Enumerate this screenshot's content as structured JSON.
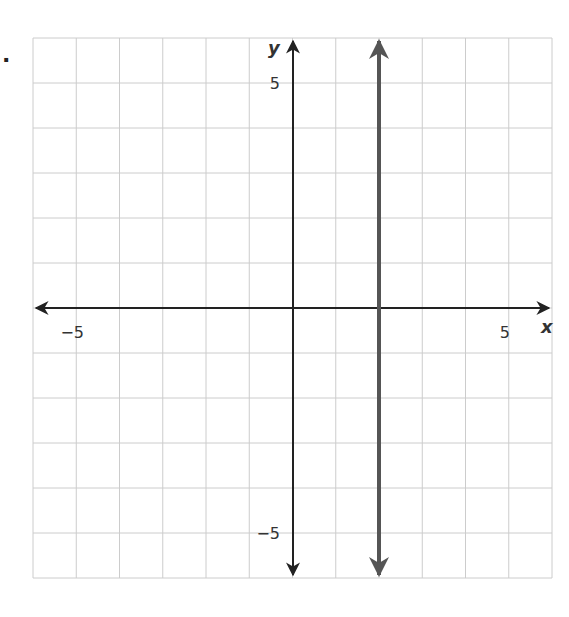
{
  "problem": {
    "marker": "."
  },
  "chart_data": {
    "type": "line",
    "title": "",
    "xlabel": "x",
    "ylabel": "y",
    "xlim": [
      -6,
      6
    ],
    "ylim": [
      -6,
      6
    ],
    "grid": true,
    "x_tick_labels": [
      {
        "value": -5,
        "label": "−5"
      },
      {
        "value": 5,
        "label": "5"
      }
    ],
    "y_tick_labels": [
      {
        "value": 5,
        "label": "5"
      },
      {
        "value": -5,
        "label": "−5"
      }
    ],
    "series": [
      {
        "name": "vertical line x = 2",
        "equation": "x = 2",
        "points": [
          [
            2,
            -6
          ],
          [
            2,
            6
          ]
        ],
        "color": "#555555",
        "arrows": "both"
      }
    ]
  },
  "colors": {
    "grid": "#cccccc",
    "axis": "#222222",
    "line": "#555555"
  }
}
